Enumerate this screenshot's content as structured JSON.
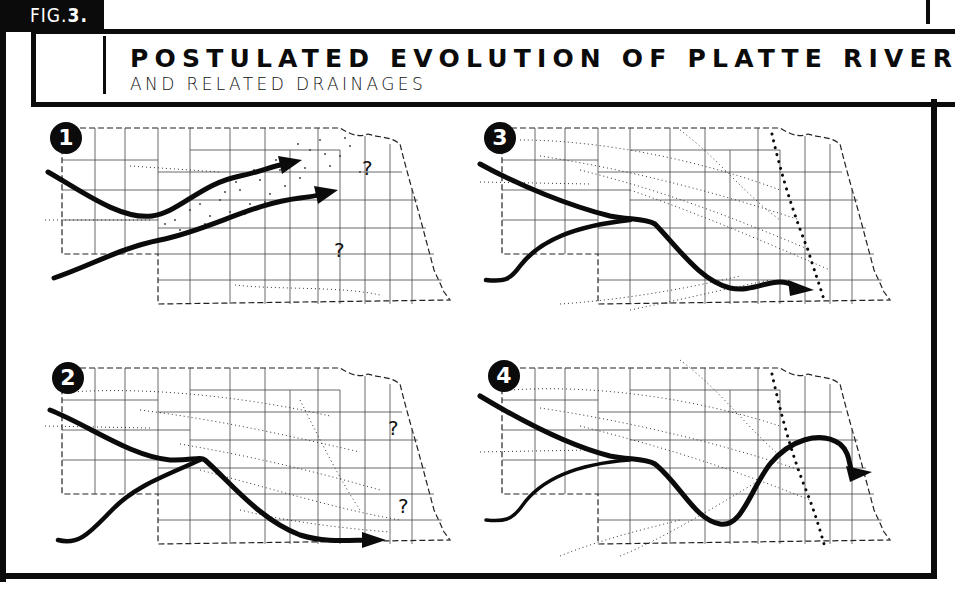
{
  "figure": {
    "label_prefix": "FIG.",
    "label_number": "3."
  },
  "title": {
    "main": "POSTULATED EVOLUTION OF PLATTE RIVER",
    "subtitle": "AND RELATED DRAINAGES"
  },
  "colors": {
    "ink": "#0b0b0b",
    "background": "#ffffff",
    "dots": "#333333"
  },
  "panels": [
    {
      "number": "1",
      "position": "top-left",
      "description": "Two parallel eastward (northeast-trending) river courses across western and central Nebraska, with stippled drainage zone; eastern continuation uncertain",
      "question_marks": [
        "?",
        "?"
      ]
    },
    {
      "number": "2",
      "position": "bottom-left",
      "description": "Two western channels merge in west-central Nebraska and flow southeast toward southern Nebraska; eastern drainage uncertain",
      "question_marks": [
        "?",
        "?"
      ]
    },
    {
      "number": "3",
      "position": "top-right",
      "description": "Merged river flows southeast to south-central/southeastern Nebraska; heavy dotted line marks a north-south divide in eastern Nebraska",
      "question_marks": []
    },
    {
      "number": "4",
      "position": "bottom-right",
      "description": "Merged river dips south then loops north and east across the dotted divide to exit in eastern Nebraska (modern Platte course)",
      "question_marks": []
    }
  ]
}
